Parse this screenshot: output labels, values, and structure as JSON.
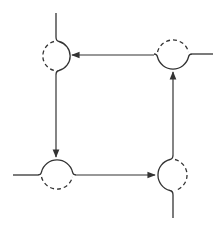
{
  "diagram": {
    "type": "cycle-flow",
    "stroke_color": "#333333",
    "background": "#ffffff",
    "nodes": [
      {
        "id": "top-left",
        "center": [
          56,
          56
        ],
        "radius": 15,
        "solid_side": "right",
        "dashed_side": "left",
        "line": "vertical"
      },
      {
        "id": "top-right",
        "center": [
          173,
          55
        ],
        "radius": 16,
        "solid_side": "bottom",
        "dashed_side": "top",
        "line": "horizontal"
      },
      {
        "id": "bottom-left",
        "center": [
          57,
          175
        ],
        "radius": 16,
        "solid_side": "top",
        "dashed_side": "bottom",
        "line": "horizontal"
      },
      {
        "id": "bottom-right",
        "center": [
          173,
          175
        ],
        "radius": 16,
        "solid_side": "left",
        "dashed_side": "right",
        "line": "vertical"
      }
    ],
    "arrows": [
      {
        "from": "top-right",
        "to": "top-left",
        "direction": "left"
      },
      {
        "from": "top-left",
        "to": "bottom-left",
        "direction": "down"
      },
      {
        "from": "bottom-left",
        "to": "bottom-right",
        "direction": "right"
      },
      {
        "from": "bottom-right",
        "to": "top-right",
        "direction": "up"
      }
    ]
  }
}
